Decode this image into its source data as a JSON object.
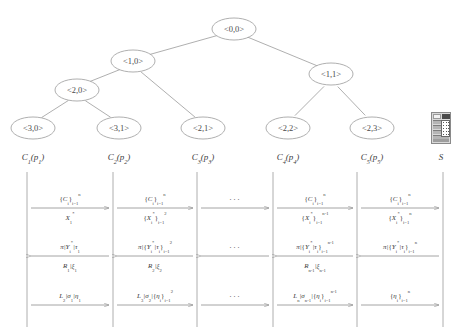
{
  "figure": {
    "tree": {
      "nodes": [
        {
          "id": "root",
          "label": "<0,0>",
          "cx": 234,
          "cy": 29
        },
        {
          "id": "n10",
          "label": "<1,0>",
          "cx": 133,
          "cy": 61
        },
        {
          "id": "n11",
          "label": "<1,1>",
          "cx": 331,
          "cy": 74
        },
        {
          "id": "n20",
          "label": "<2,0>",
          "cx": 77,
          "cy": 90
        },
        {
          "id": "n30",
          "label": "<3,0>",
          "cx": 33,
          "cy": 128
        },
        {
          "id": "n31",
          "label": "<3,1>",
          "cx": 119,
          "cy": 128
        },
        {
          "id": "n21",
          "label": "<2,1>",
          "cx": 203,
          "cy": 128
        },
        {
          "id": "n22",
          "label": "<2,2>",
          "cx": 288,
          "cy": 128
        },
        {
          "id": "n23",
          "label": "<2,3>",
          "cx": 372,
          "cy": 128
        }
      ],
      "edges": [
        [
          "root",
          "n10"
        ],
        [
          "root",
          "n11"
        ],
        [
          "n10",
          "n20"
        ],
        [
          "n10",
          "n21"
        ],
        [
          "n20",
          "n30"
        ],
        [
          "n20",
          "n31"
        ],
        [
          "n11",
          "n22"
        ],
        [
          "n11",
          "n23"
        ]
      ],
      "leaf_captions": [
        {
          "id": "c1",
          "text": "C",
          "sub": "1",
          "arg": "(p",
          "argsub": "1",
          "close": ")",
          "cx": 33,
          "cy": 157
        },
        {
          "id": "c2",
          "text": "C",
          "sub": "2",
          "arg": "(p",
          "argsub": "2",
          "close": ")",
          "cx": 119,
          "cy": 157
        },
        {
          "id": "c3",
          "text": "C",
          "sub": "3",
          "arg": "(p",
          "argsub": "3",
          "close": ")",
          "cx": 203,
          "cy": 157
        },
        {
          "id": "c4",
          "text": "C",
          "sub": "4",
          "arg": "(p",
          "argsub": "4",
          "close": ")",
          "cx": 288,
          "cy": 157
        },
        {
          "id": "c5",
          "text": "C",
          "sub": "5",
          "arg": "(p",
          "argsub": "5",
          "close": ")",
          "cx": 372,
          "cy": 157
        }
      ],
      "server": {
        "label": "S",
        "icon": "server-tower-icon",
        "cx": 441,
        "cy": 157
      }
    },
    "sequence": {
      "lifeline_x": [
        27,
        113,
        197,
        273,
        357,
        443
      ],
      "lifeline_top": 0,
      "lifeline_bottom": 155,
      "rows": [
        {
          "id": "row-1",
          "arrow_y": 36,
          "direction": "right",
          "messages": [
            {
              "col": 0,
              "above": "{C_i}_{i=1}^{n}",
              "below": "X_1^*"
            },
            {
              "col": 1,
              "above": "{C_i}_{i=1}^{n}",
              "below": "{X_i^*}_{i=1}^{2}"
            },
            {
              "col": 2,
              "above": "...",
              "below": ""
            },
            {
              "col": 3,
              "above": "{C_i}_{i=1}^{n}",
              "below": "{X_i^*}_{i=1}^{n-1}"
            },
            {
              "col": 4,
              "above": "{C_i}_{i=1}^{n}",
              "below": "{X_i^*}_{i=1}^{n}"
            }
          ]
        },
        {
          "id": "row-2",
          "arrow_y": 84,
          "direction": "left",
          "messages": [
            {
              "col": 0,
              "above": "pi|Y_i^*|tau_1",
              "below": "R_1|xi_1"
            },
            {
              "col": 1,
              "above": "pi|{Y_i^*|tau_i}_{i=1}^{2}",
              "below": "R_2|xi_2"
            },
            {
              "col": 2,
              "above": "...",
              "below": ""
            },
            {
              "col": 3,
              "above": "pi|{Y_i^*|tau_i}_{i=1}^{n-1}",
              "below": "R_{n-1}|xi_{n-1}"
            },
            {
              "col": 4,
              "above": "pi|{Y_i^*|tau_i}_{i=1}^{n}",
              "below": ""
            }
          ]
        },
        {
          "id": "row-3",
          "arrow_y": 133,
          "direction": "right",
          "messages": [
            {
              "col": 0,
              "above": "L_2|sigma_1|eta_1",
              "below": ""
            },
            {
              "col": 1,
              "above": "L_3|sigma_2|{eta_i}_{i=1}^{2}",
              "below": ""
            },
            {
              "col": 2,
              "above": "...",
              "below": ""
            },
            {
              "col": 3,
              "above": "L_n|sigma_{n-1}|{eta_i}_{i=1}^{n-1}",
              "below": ""
            },
            {
              "col": 4,
              "above": "{eta_i}_{i=1}^{n}",
              "below": ""
            }
          ]
        }
      ]
    },
    "colors": {
      "stroke": "#9a9a9a",
      "text": "#3c3c3c",
      "background": "#ffffff"
    }
  }
}
